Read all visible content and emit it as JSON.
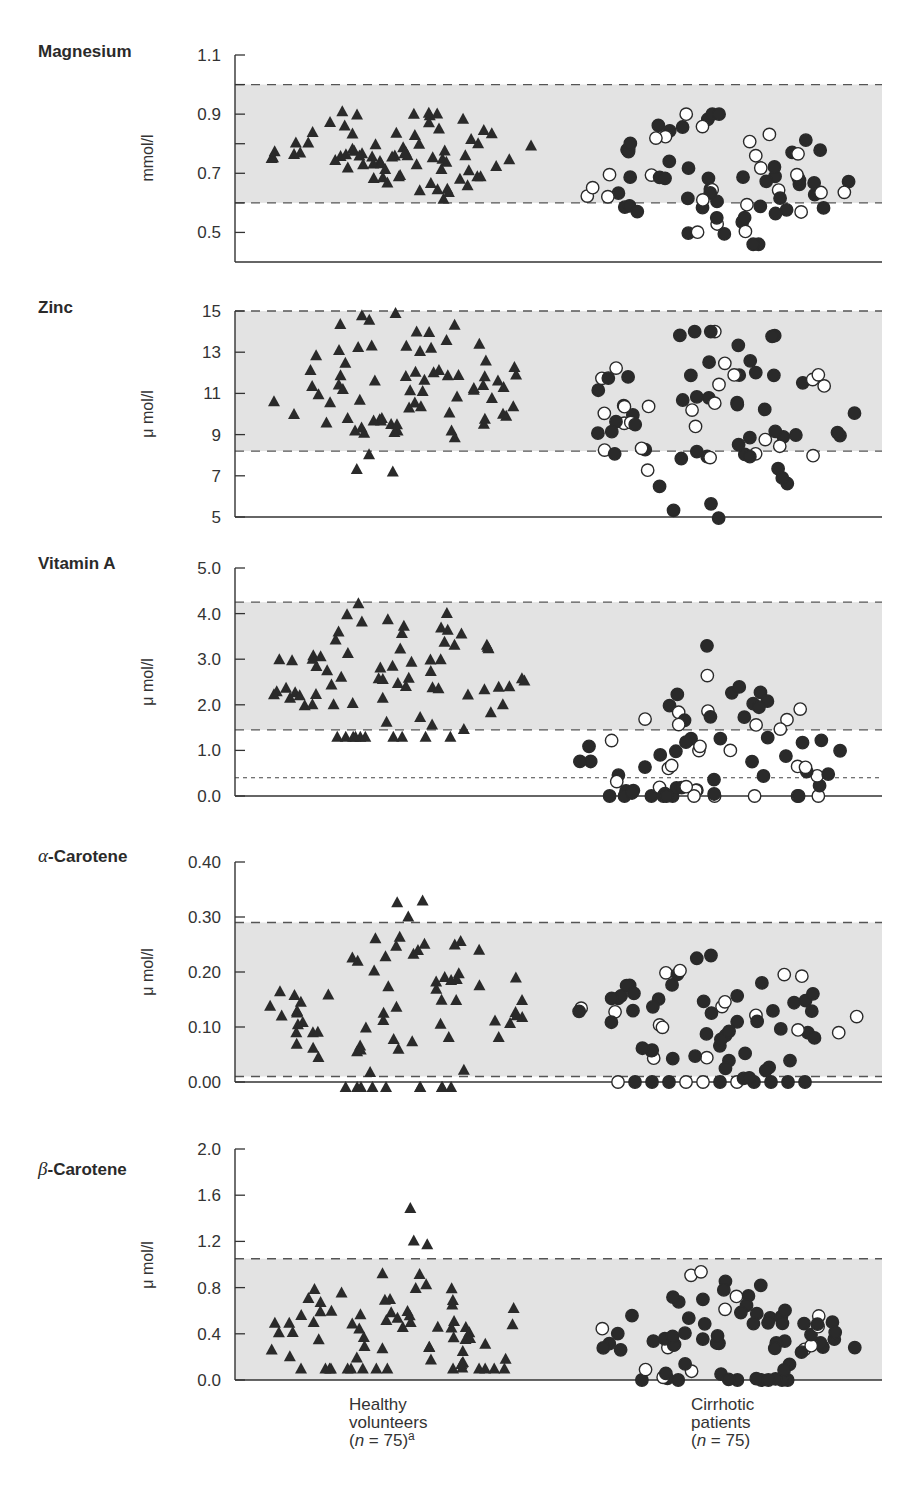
{
  "chart_data": [
    {
      "type": "scatter",
      "title": "Magnesium",
      "ylabel": "mmol/l",
      "ylim": [
        0.4,
        1.1
      ],
      "yticks": [
        "1.1",
        "0.9",
        "0.7",
        "0.5"
      ],
      "yticks_values": [
        1.1,
        0.9,
        0.7,
        0.5
      ],
      "minor_ticks": [
        1.0,
        0.8,
        0.6
      ],
      "reference_range": [
        0.6,
        1.0
      ],
      "categories": [
        "Healthy volunteers",
        "Cirrhotic patients"
      ],
      "healthy": {
        "marker": "filled-triangle",
        "n": 75,
        "range": [
          0.56,
          0.91
        ],
        "center": 0.78
      },
      "cirrhotic": {
        "marker": "filled/open circle",
        "n": 75,
        "range": [
          0.46,
          0.9
        ],
        "center": 0.68
      }
    },
    {
      "type": "scatter",
      "title": "Zinc",
      "ylabel": "μmol/l",
      "ylim": [
        5,
        15
      ],
      "yticks": [
        "15",
        "13",
        "11",
        "9",
        "7",
        "5"
      ],
      "yticks_values": [
        15,
        13,
        11,
        9,
        7,
        5
      ],
      "reference_range": [
        8.2,
        15
      ],
      "categories": [
        "Healthy volunteers",
        "Cirrhotic patients"
      ],
      "healthy": {
        "marker": "filled-triangle",
        "n": 75,
        "range": [
          7.2,
          14.9
        ],
        "center": 11.2
      },
      "cirrhotic": {
        "marker": "filled/open circle",
        "n": 75,
        "range": [
          4.8,
          14.0
        ],
        "center": 10.0
      }
    },
    {
      "type": "scatter",
      "title": "Vitamin A",
      "ylabel": "μmol/l",
      "ylim": [
        0.0,
        5.0
      ],
      "yticks": [
        "5.0",
        "4.0",
        "3.0",
        "2.0",
        "1.0",
        "0.0"
      ],
      "yticks_values": [
        5.0,
        4.0,
        3.0,
        2.0,
        1.0,
        0.0
      ],
      "reference_range": [
        1.45,
        4.25
      ],
      "detection_limit": 0.4,
      "categories": [
        "Healthy volunteers",
        "Cirrhotic patients"
      ],
      "healthy": {
        "marker": "filled-triangle",
        "n": 75,
        "range": [
          1.3,
          4.6
        ],
        "center": 2.6
      },
      "cirrhotic": {
        "marker": "filled/open circle",
        "n": 75,
        "range": [
          0.0,
          3.5
        ],
        "center": 0.8
      }
    },
    {
      "type": "scatter",
      "title": "α-Carotene",
      "ylabel": "μmol/l",
      "ylim": [
        0.0,
        0.4
      ],
      "yticks": [
        "0.40",
        "0.30",
        "0.20",
        "0.10",
        "0.00"
      ],
      "yticks_values": [
        0.4,
        0.3,
        0.2,
        0.1,
        0.0
      ],
      "reference_range": [
        0.01,
        0.29
      ],
      "categories": [
        "Healthy volunteers",
        "Cirrhotic patients"
      ],
      "healthy": {
        "marker": "filled-triangle",
        "n": 75,
        "range": [
          0.0,
          0.33
        ],
        "center": 0.14,
        "undetectable_count": 7
      },
      "cirrhotic": {
        "marker": "filled/open circle",
        "n": 75,
        "range": [
          0.0,
          0.23
        ],
        "center": 0.12,
        "undetectable_count": 12
      }
    },
    {
      "type": "scatter",
      "title": "β-Carotene",
      "ylabel": "μmol/l",
      "ylim": [
        0.0,
        2.0
      ],
      "yticks": [
        "2.0",
        "1.6",
        "1.2",
        "0.8",
        "0.4",
        "0.0"
      ],
      "yticks_values": [
        2.0,
        1.6,
        1.2,
        0.8,
        0.4,
        0.0
      ],
      "reference_range": [
        0.0,
        1.05
      ],
      "categories": [
        "Healthy volunteers",
        "Cirrhotic patients"
      ],
      "healthy": {
        "marker": "filled-triangle",
        "n": 75,
        "range": [
          0.1,
          1.55
        ],
        "center": 0.4
      },
      "cirrhotic": {
        "marker": "filled/open circle",
        "n": 75,
        "range": [
          0.0,
          1.05
        ],
        "center": 0.3
      }
    }
  ],
  "panels": [
    {
      "title_prefix": "",
      "title": "Magnesium",
      "unit": "mmol/l",
      "ticks": [
        "1.1",
        "0.9",
        "0.7",
        "0.5"
      ]
    },
    {
      "title_prefix": "",
      "title": "Zinc",
      "unit": "μ mol/l",
      "ticks": [
        "15",
        "13",
        "11",
        "9",
        "7",
        "5"
      ]
    },
    {
      "title_prefix": "",
      "title": "Vitamin A",
      "unit": "μ mol/l",
      "ticks": [
        "5.0",
        "4.0",
        "3.0",
        "2.0",
        "1.0",
        "0.0"
      ]
    },
    {
      "title_prefix": "α",
      "title": "-Carotene",
      "unit": "μ mol/l",
      "ticks": [
        "0.40",
        "0.30",
        "0.20",
        "0.10",
        "0.00"
      ]
    },
    {
      "title_prefix": "β",
      "title": "-Carotene",
      "unit": "μ mol/l",
      "ticks": [
        "2.0",
        "1.6",
        "1.2",
        "0.8",
        "0.4",
        "0.0"
      ]
    }
  ],
  "groups": {
    "healthy": {
      "line1": "Healthy",
      "line2": "volunteers",
      "line3": "(n = 75)",
      "n_label": "n",
      "n_value": " = 75)",
      "superscript": "a"
    },
    "cirrhotic": {
      "line1": "Cirrhotic",
      "line2": "patients",
      "n_label": "n",
      "n_value": " = 75)"
    }
  },
  "colors": {
    "band": "#e3e3e3",
    "ink": "#2a2a2a",
    "axis": "#333333"
  }
}
